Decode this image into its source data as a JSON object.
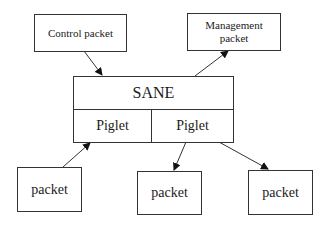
{
  "diagram": {
    "nodes": {
      "control_packet": {
        "label": "Control packet"
      },
      "management_packet": {
        "label": "Management packet"
      },
      "sane": {
        "label": "SANE"
      },
      "piglet_left": {
        "label": "Piglet"
      },
      "piglet_right": {
        "label": "Piglet"
      },
      "packet_left": {
        "label": "packet"
      },
      "packet_middle": {
        "label": "packet"
      },
      "packet_right": {
        "label": "packet"
      }
    },
    "edges": [
      {
        "from": "control_packet",
        "to": "sane"
      },
      {
        "from": "sane",
        "to": "management_packet"
      },
      {
        "from": "packet_left",
        "to": "piglet_left"
      },
      {
        "from": "piglet_right",
        "to": "packet_middle"
      },
      {
        "from": "piglet_right",
        "to": "packet_right"
      }
    ]
  }
}
